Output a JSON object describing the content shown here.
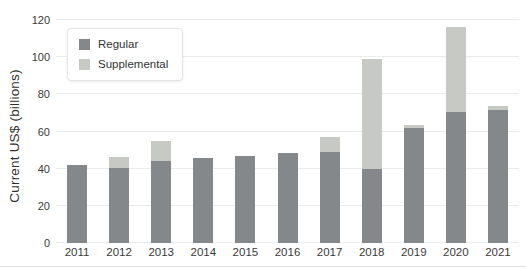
{
  "chart_data": {
    "type": "bar",
    "stacked": true,
    "title": "",
    "xlabel": "",
    "ylabel": "Current US$ (billions)",
    "categories": [
      "2011",
      "2012",
      "2013",
      "2014",
      "2015",
      "2016",
      "2017",
      "2018",
      "2019",
      "2020",
      "2021"
    ],
    "series": [
      {
        "name": "Regular",
        "color": "#85888b",
        "values": [
          42,
          40.5,
          44,
          46,
          47,
          48.5,
          49,
          40,
          62,
          70.5,
          71.5
        ]
      },
      {
        "name": "Supplemental",
        "color": "#c6c9c4",
        "values": [
          0,
          6,
          11,
          0,
          0,
          0,
          8,
          59,
          1.5,
          45.5,
          2
        ]
      }
    ],
    "totals": [
      42,
      46.5,
      55,
      46,
      47,
      48.5,
      57,
      99,
      63.5,
      116,
      73.5
    ],
    "ylim": [
      0,
      120
    ],
    "yticks": [
      0,
      20,
      40,
      60,
      80,
      100,
      120
    ],
    "grid": true,
    "legend_position": "upper-left"
  },
  "colors": {
    "background": "#ffffff",
    "gridline": "#e9eaea",
    "axis_text": "#3a3a3a",
    "legend_border": "#e4e4e4",
    "bottom_rule": "#dedede"
  }
}
